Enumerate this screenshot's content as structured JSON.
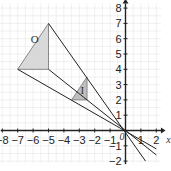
{
  "figure": {
    "type": "enlargement-diagram",
    "axes": {
      "x_label": "x",
      "y_label": "y",
      "x_ticks": [
        "-8",
        "-7",
        "-6",
        "-5",
        "-4",
        "-3",
        "-2",
        "-1",
        "1",
        "2"
      ],
      "y_ticks": [
        "8",
        "7",
        "6",
        "5",
        "4",
        "3",
        "2",
        "1",
        "-1",
        "-2"
      ],
      "origin_label": "0",
      "x_range": [
        -8,
        2
      ],
      "y_range": [
        -2,
        8
      ]
    },
    "shapes": [
      {
        "label": "O",
        "vertices": [
          [
            -5,
            7
          ],
          [
            -7,
            4
          ],
          [
            -5,
            4
          ]
        ],
        "fill": "#d9d9d9"
      },
      {
        "label": "I",
        "vertices": [
          [
            -2.5,
            3.5
          ],
          [
            -3.5,
            2
          ],
          [
            -2.5,
            2
          ]
        ],
        "fill": "#bfbfbf"
      }
    ],
    "rays": [
      {
        "from": [
          -5,
          7
        ],
        "to": [
          1.3,
          -2
        ]
      },
      {
        "from": [
          -7,
          4
        ],
        "to": [
          2,
          -1.2
        ]
      },
      {
        "from": [
          -5,
          4
        ],
        "to": [
          2,
          -1.6
        ]
      }
    ],
    "colors": {
      "grid": "#e6e6e6",
      "axis": "#222222",
      "ray": "#222222",
      "shape_stroke": "#888888"
    }
  }
}
